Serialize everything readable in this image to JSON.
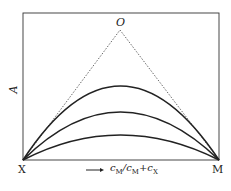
{
  "diagram": {
    "labels": {
      "top_vertex": "O",
      "y_axis": "A",
      "left_corner": "X",
      "right_corner": "M",
      "x_axis_main": "c",
      "x_axis_sub1": "M",
      "x_axis_slash": "/c",
      "x_axis_sub2": "M",
      "x_axis_plus": "+c",
      "x_axis_sub3": "X"
    },
    "curves": [
      "upper-arc",
      "middle-arc",
      "lower-arc"
    ],
    "colors": {
      "line": "#222222",
      "dotted": "#444444"
    }
  }
}
